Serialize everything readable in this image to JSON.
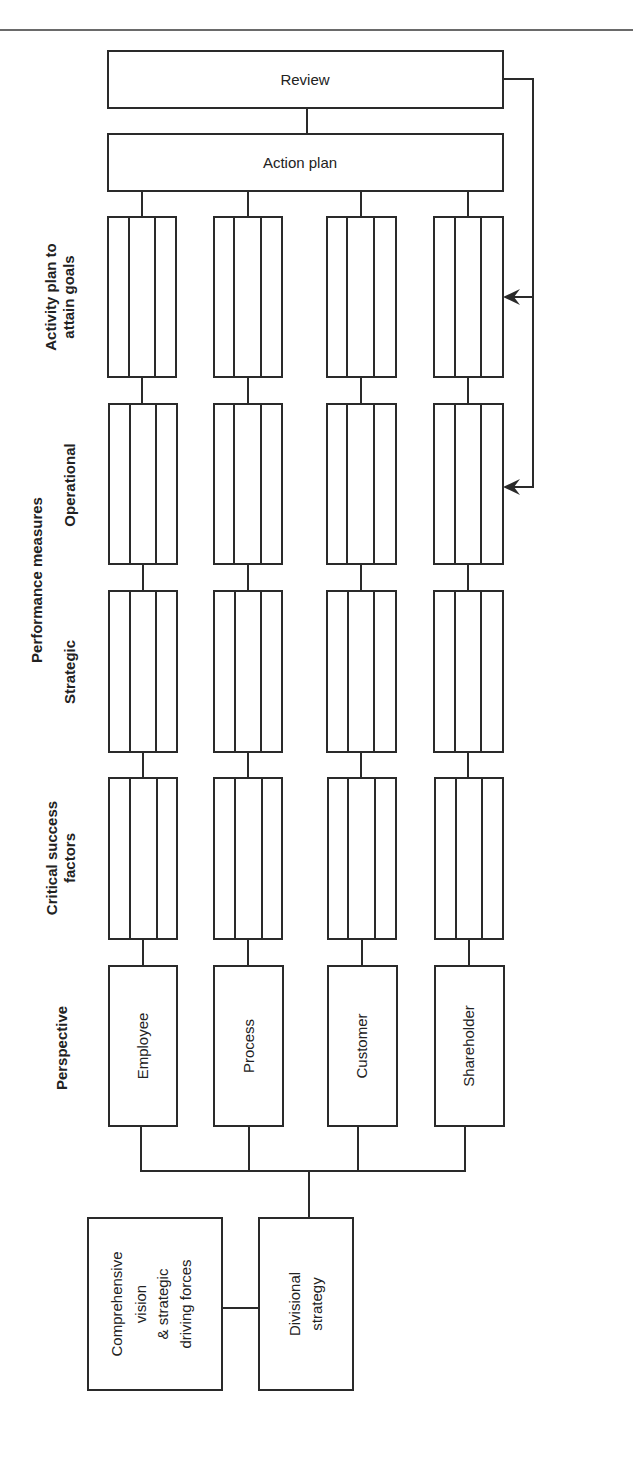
{
  "diagram": {
    "top_boxes": {
      "review": "Review",
      "action_plan": "Action plan"
    },
    "row_labels": {
      "activity_plan": [
        "Activity plan to",
        "attain goals"
      ],
      "performance_measures": "Performance measures",
      "operational": "Operational",
      "strategic": "Strategic",
      "critical_success_factors": [
        "Critical success",
        "factors"
      ],
      "perspective": "Perspective"
    },
    "perspectives": [
      "Employee",
      "Process",
      "Customer",
      "Shareholder"
    ],
    "bottom_boxes": {
      "comprehensive": [
        "Comprehensive",
        "vision",
        "& strategic",
        "driving forces"
      ],
      "divisional": [
        "Divisional",
        "strategy"
      ]
    },
    "feedback_arrows": {
      "from": "Review",
      "to": [
        "Activity plan to attain goals",
        "Operational"
      ]
    },
    "colors": {
      "line": "#2a2a2a",
      "rule": "#6a6a6a",
      "background": "#ffffff"
    }
  }
}
